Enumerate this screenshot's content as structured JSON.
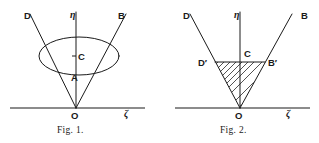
{
  "page": {
    "background_color": "#ffffff",
    "ink_color": "#1a1a1a",
    "width": 319,
    "height": 143
  },
  "figures": [
    {
      "id": "fig1",
      "caption": "Fig. 1.",
      "description": "Cone with elliptical (circular) cross-section, vertex at O",
      "labels": {
        "left_ray": "D",
        "vertical_axis": "η",
        "right_ray": "B",
        "ellipse_center": "C",
        "apex_point": "A",
        "origin": "O",
        "horizontal_axis": "ζ"
      },
      "geometry": {
        "origin": {
          "x": 76,
          "y": 108
        },
        "left_ray_end": {
          "x": 30,
          "y": 14
        },
        "right_ray_end": {
          "x": 126,
          "y": 14
        },
        "vertical_axis_top": {
          "x": 76,
          "y": 12
        },
        "horizontal_axis": {
          "x1": 10,
          "x2": 145,
          "y": 108
        },
        "ellipse": {
          "cx": 79,
          "cy": 56,
          "rx": 40,
          "ry": 19
        },
        "point_A": {
          "x": 76,
          "y": 71
        }
      }
    },
    {
      "id": "fig2",
      "caption": "Fig. 2.",
      "description": "Same cone with hatched triangle D'B'O cross-section",
      "labels": {
        "left_ray": "D",
        "vertical_axis": "η",
        "right_ray": "B",
        "chord_center": "C",
        "chord_left": "D′",
        "chord_right": "B′",
        "origin": "O",
        "horizontal_axis": "ζ"
      },
      "geometry": {
        "origin": {
          "x": 240,
          "y": 108
        },
        "left_ray_end": {
          "x": 190,
          "y": 14
        },
        "right_ray_end": {
          "x": 292,
          "y": 14
        },
        "vertical_axis_top": {
          "x": 240,
          "y": 12
        },
        "horizontal_axis": {
          "x1": 175,
          "x2": 310,
          "y": 108
        },
        "chord_left_point": {
          "x": 215,
          "y": 62
        },
        "chord_right_point": {
          "x": 265,
          "y": 62
        },
        "hatch_line_count": 13,
        "hatch_angle_deg": 45
      }
    }
  ]
}
